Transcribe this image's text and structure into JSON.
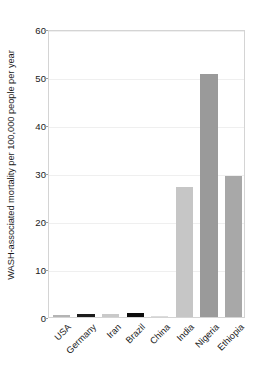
{
  "chart_data": {
    "type": "bar",
    "title": "",
    "subtitle": "",
    "xlabel": "",
    "ylabel": "WASH-associated mortality per 100,000 people per year",
    "categories": [
      "USA",
      "Germany",
      "Iran",
      "Brazil",
      "China",
      "India",
      "Nigeria",
      "Ethiopia"
    ],
    "values": [
      0.4,
      0.7,
      0.6,
      0.9,
      0.2,
      27.1,
      50.6,
      29.3
    ],
    "bar_colors": [
      "#b4b4b4",
      "#1c1c1c",
      "#c9c9c9",
      "#0d0d0d",
      "#dcdcdc",
      "#c6c6c6",
      "#9a9a9a",
      "#a8a8a8"
    ],
    "ylim": [
      0,
      60
    ],
    "yticks": [
      0,
      10,
      20,
      30,
      40,
      50,
      60
    ],
    "ytick_labels": [
      "0",
      "10",
      "20",
      "30",
      "40",
      "50",
      "60"
    ],
    "grid": true,
    "grid_axis": "y",
    "legend": null,
    "legend_position": "none",
    "annotations": []
  },
  "figure": {
    "background_color": "#ffffff",
    "axes_border_color": "#d4d4d4",
    "grid_color": "#efefef",
    "text_color": "#1a1a1a",
    "xtick_rotation": -45
  }
}
